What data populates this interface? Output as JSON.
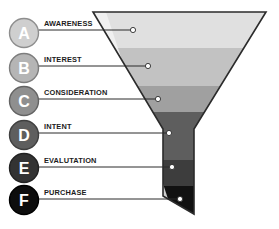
{
  "diagram": {
    "type": "funnel",
    "background": "#ffffff",
    "funnel": {
      "outline_color": "#2b2b2b",
      "highlight_stripe_color": "#f2f2f2",
      "cone": {
        "top_left_x": 93,
        "top_right_x": 266,
        "top_y": 12,
        "neck_left_x": 163,
        "neck_right_x": 194,
        "neck_top_y": 129,
        "bottom_y": 214,
        "bottom_cut_left_y": 196
      }
    },
    "stages": [
      {
        "key": "A",
        "letter": "A",
        "label": "AWARENESS",
        "badge_fill": "#cfcfcf",
        "badge_stroke": "#8e8e8e",
        "band_fill": "#e0e0e0",
        "band_top": 12,
        "band_bottom": 48,
        "badge_cy": 33,
        "line_y": 30,
        "dot_x": 133,
        "dot_y": 30
      },
      {
        "key": "B",
        "letter": "B",
        "label": "INTEREST",
        "badge_fill": "#b5b5b5",
        "badge_stroke": "#7d7d7d",
        "band_fill": "#c2c2c2",
        "band_top": 48,
        "band_bottom": 86,
        "badge_cy": 68,
        "line_y": 66,
        "dot_x": 148,
        "dot_y": 66
      },
      {
        "key": "C",
        "letter": "C",
        "label": "CONSIDERATION",
        "badge_fill": "#8f8f8f",
        "badge_stroke": "#636363",
        "band_fill": "#a0a0a0",
        "band_top": 86,
        "band_bottom": 112,
        "badge_cy": 101,
        "line_y": 99,
        "dot_x": 158,
        "dot_y": 99
      },
      {
        "key": "D",
        "letter": "D",
        "label": "INTENT",
        "badge_fill": "#5e5e5e",
        "badge_stroke": "#3f3f3f",
        "band_fill": "#5e5e5e",
        "band_top": 112,
        "band_bottom": 160,
        "badge_cy": 135,
        "line_y": 133,
        "dot_x": 169,
        "dot_y": 133
      },
      {
        "key": "E",
        "letter": "E",
        "label": "EVALUTATION",
        "badge_fill": "#333333",
        "badge_stroke": "#222222",
        "band_fill": "#3d3d3d",
        "band_top": 160,
        "band_bottom": 186,
        "badge_cy": 168,
        "line_y": 167,
        "dot_x": 172,
        "dot_y": 167
      },
      {
        "key": "F",
        "letter": "F",
        "label": "PURCHASE",
        "badge_fill": "#0d0d0d",
        "badge_stroke": "#000000",
        "band_fill": "#111111",
        "band_top": 186,
        "band_bottom": 214,
        "badge_cy": 200,
        "line_y": 199,
        "dot_x": 180,
        "dot_y": 199
      }
    ],
    "connector": {
      "line_color": "#2b2b2b",
      "label_x": 44,
      "badge_cx": 24,
      "badge_r": 14.5,
      "dot_fill": "#ffffff",
      "dot_stroke": "#2b2b2b",
      "dot_r": 2.6
    }
  }
}
